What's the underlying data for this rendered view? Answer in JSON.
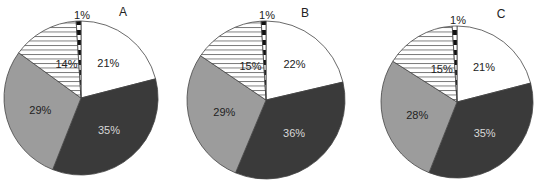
{
  "chart_data": [
    {
      "type": "pie",
      "title": "A",
      "categories": [
        "white",
        "dark",
        "gray",
        "horizontal-hatched",
        "dashed"
      ],
      "values": [
        21,
        35,
        29,
        14,
        1
      ],
      "labels": [
        "21%",
        "35%",
        "29%",
        "14%",
        "1%"
      ],
      "start_angle_deg": 0,
      "direction": "clockwise"
    },
    {
      "type": "pie",
      "title": "B",
      "categories": [
        "white",
        "dark",
        "gray",
        "horizontal-hatched",
        "dashed"
      ],
      "values": [
        22,
        36,
        29,
        15,
        1
      ],
      "labels": [
        "22%",
        "36%",
        "29%",
        "15%",
        "1%"
      ],
      "start_angle_deg": 0,
      "direction": "clockwise"
    },
    {
      "type": "pie",
      "title": "C",
      "categories": [
        "white",
        "dark",
        "gray",
        "horizontal-hatched",
        "dashed"
      ],
      "values": [
        21,
        35,
        28,
        15,
        1
      ],
      "labels": [
        "21%",
        "35%",
        "28%",
        "15%",
        "1%"
      ],
      "start_angle_deg": 0,
      "direction": "clockwise"
    }
  ],
  "colors": {
    "white": "#ffffff",
    "dark": "#3a3a3a",
    "gray": "#9c9c9c",
    "hatch_line": "#555555",
    "outline": "#444444"
  },
  "panels": [
    {
      "letter": "A",
      "cx": 81,
      "cy": 98,
      "r": 77,
      "left": 0
    },
    {
      "letter": "B",
      "cx": 86,
      "cy": 100,
      "r": 79,
      "left": 180
    },
    {
      "letter": "C",
      "cx": 97,
      "cy": 102,
      "r": 76,
      "left": 360
    }
  ]
}
